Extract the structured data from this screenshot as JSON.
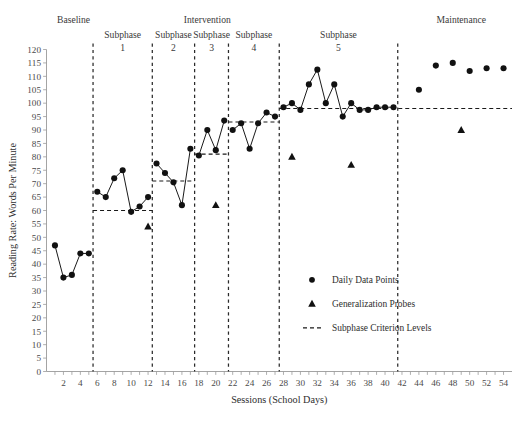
{
  "chart_data": {
    "type": "line",
    "title": "",
    "xlabel": "Sessions (School Days)",
    "ylabel": "Reading Rate: Words Per Minute",
    "xlim": [
      0,
      55
    ],
    "ylim": [
      0,
      120
    ],
    "grid": false,
    "y_ticks": [
      0,
      5,
      10,
      15,
      20,
      25,
      30,
      35,
      40,
      45,
      50,
      55,
      60,
      65,
      70,
      75,
      80,
      85,
      90,
      95,
      100,
      105,
      110,
      115,
      120
    ],
    "x_ticks": [
      2,
      4,
      6,
      8,
      10,
      12,
      14,
      16,
      18,
      20,
      22,
      24,
      26,
      28,
      30,
      32,
      34,
      36,
      38,
      40,
      42,
      44,
      46,
      48,
      50,
      52,
      54
    ],
    "x_tick_step": 1,
    "series": [
      {
        "name": "Daily Data Points",
        "marker": "circle",
        "connected": true,
        "x": [
          1,
          2,
          3,
          4,
          5
        ],
        "values": [
          47,
          35,
          36,
          44,
          44
        ],
        "segment": "Baseline"
      },
      {
        "name": "Daily Data Points",
        "marker": "circle",
        "connected": true,
        "x": [
          6,
          7,
          8,
          9,
          10,
          11,
          12
        ],
        "values": [
          67,
          65,
          72,
          75,
          59.5,
          61.5,
          65
        ],
        "segment": "Intervention Subphase 1"
      },
      {
        "name": "Daily Data Points",
        "marker": "circle",
        "connected": true,
        "x": [
          13,
          14,
          15,
          16,
          17
        ],
        "values": [
          77.5,
          74,
          70.5,
          62,
          83
        ],
        "segment": "Intervention Subphase 2"
      },
      {
        "name": "Daily Data Points",
        "marker": "circle",
        "connected": true,
        "x": [
          18,
          19,
          20,
          21
        ],
        "values": [
          80.5,
          90,
          82.5,
          93.5
        ],
        "segment": "Intervention Subphase 3"
      },
      {
        "name": "Daily Data Points",
        "marker": "circle",
        "connected": true,
        "x": [
          22,
          23,
          24,
          25,
          26,
          27
        ],
        "values": [
          90,
          92.5,
          83,
          92.5,
          96.5,
          95
        ],
        "segment": "Intervention Subphase 4"
      },
      {
        "name": "Daily Data Points",
        "marker": "circle",
        "connected": true,
        "x": [
          28,
          29,
          30,
          31,
          32,
          33,
          34,
          35,
          36,
          37,
          38,
          39,
          40,
          41
        ],
        "values": [
          98.5,
          100,
          97.5,
          107,
          112.5,
          100,
          107,
          95,
          100,
          97.5,
          97.5,
          98.5,
          98.5,
          98.5
        ],
        "segment": "Intervention Subphase 5"
      },
      {
        "name": "Daily Data Points",
        "marker": "circle",
        "connected": false,
        "x": [
          44,
          46,
          48,
          50,
          52,
          54
        ],
        "values": [
          105,
          114,
          115,
          112,
          113,
          113
        ],
        "segment": "Maintenance"
      }
    ],
    "generalization_probes": {
      "name": "Generalization Probes",
      "marker": "triangle",
      "x": [
        12,
        20,
        29,
        36,
        49
      ],
      "values": [
        54,
        62,
        80,
        77,
        90
      ]
    },
    "criterion_levels": {
      "name": "Subphase Criterion Levels",
      "lines": [
        {
          "x_start": 5.5,
          "x_end": 12.5,
          "y": 60
        },
        {
          "x_start": 12.5,
          "x_end": 17.5,
          "y": 71
        },
        {
          "x_start": 17.5,
          "x_end": 21.5,
          "y": 81
        },
        {
          "x_start": 21.5,
          "x_end": 27.5,
          "y": 93
        },
        {
          "x_start": 27.5,
          "x_end": 55,
          "y": 98
        }
      ]
    },
    "phase_lines": [
      5.5,
      12.5,
      17.5,
      21.5,
      27.5,
      41.5
    ],
    "phase_labels": [
      {
        "text": "Baseline",
        "x_center": 3.2,
        "row": 0
      },
      {
        "text": "Intervention",
        "x_center": 19.0,
        "row": 0
      },
      {
        "text": "Maintenance",
        "x_center": 49.0,
        "row": 0
      }
    ],
    "subphase_labels": [
      {
        "name": "Subphase",
        "number": "1",
        "x_center": 9.0
      },
      {
        "name": "Subphase",
        "number": "2",
        "x_center": 15.0
      },
      {
        "name": "Subphase",
        "number": "3",
        "x_center": 19.5
      },
      {
        "name": "Subphase",
        "number": "4",
        "x_center": 24.5
      },
      {
        "name": "Subphase",
        "number": "5",
        "x_center": 34.5
      }
    ],
    "legend": {
      "position": "bottom-right",
      "entries": [
        {
          "label": "Daily Data Points",
          "marker": "circle"
        },
        {
          "label": "Generalization Probes",
          "marker": "triangle"
        },
        {
          "label": "Subphase Criterion Levels",
          "marker": "dashed-line"
        }
      ]
    }
  }
}
